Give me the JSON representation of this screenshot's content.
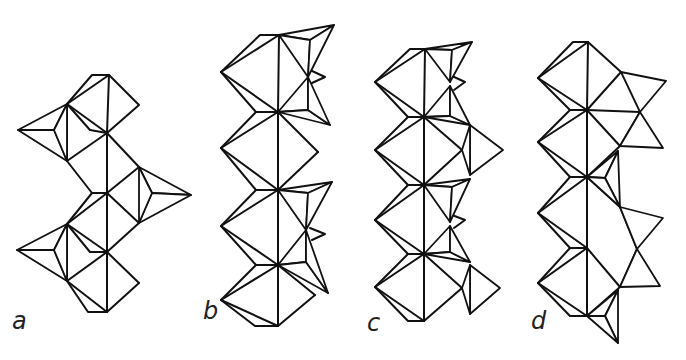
{
  "figure": {
    "type": "crystal-structure-polyhedral-chains",
    "colors": {
      "line": "#111111",
      "hatch": "#111111",
      "background": "#ffffff"
    },
    "panels": [
      {
        "id": "a",
        "label": "a",
        "octahedra_chain": "zig-zag, 4 octahedra",
        "tetrahedra": 3,
        "tetrahedra_sides": [
          "left",
          "right",
          "left"
        ]
      },
      {
        "id": "b",
        "label": "b",
        "octahedra_chain": "straight, 5 octahedra",
        "tetrahedra": 4,
        "tetrahedra_sides": [
          "right",
          "right",
          "right",
          "right"
        ]
      },
      {
        "id": "c",
        "label": "c",
        "octahedra_chain": "straight, 4 octahedra",
        "tetrahedra": 6,
        "tetrahedra_sides": [
          "right",
          "right",
          "right",
          "right",
          "right",
          "right"
        ]
      },
      {
        "id": "d",
        "label": "d",
        "octahedra_chain": "straight, 4 octahedra",
        "tetrahedra": 6,
        "tetrahedra_sides": [
          "right",
          "right",
          "right",
          "right",
          "right",
          "right"
        ]
      }
    ]
  },
  "caption": {
    "text": ""
  }
}
